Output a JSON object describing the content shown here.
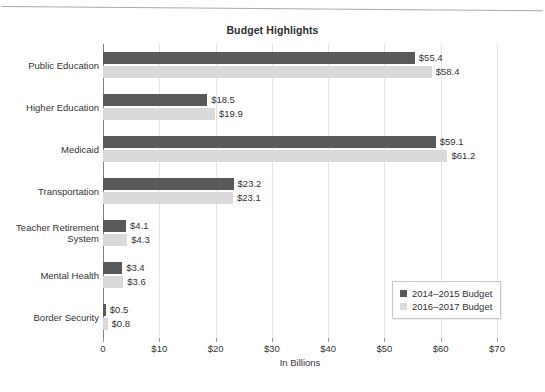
{
  "chart_data": {
    "type": "bar",
    "orientation": "horizontal",
    "title": "Budget Highlights",
    "xlabel": "In Billions",
    "ylabel": "",
    "xlim": [
      0,
      70
    ],
    "xticks": [
      0,
      10,
      20,
      30,
      40,
      50,
      60,
      70
    ],
    "xtick_labels": [
      "0",
      "$10",
      "$20",
      "$30",
      "$40",
      "$50",
      "$60",
      "$70"
    ],
    "grid": true,
    "grid_axis": "x",
    "legend_position": "lower right",
    "categories": [
      "Public Education",
      "Higher Education",
      "Medicaid",
      "Transportation",
      "Teacher Retirement System",
      "Mental Health",
      "Border Security"
    ],
    "series": [
      {
        "name": "2014–2015 Budget",
        "color": "#595959",
        "values": [
          55.4,
          18.5,
          59.1,
          23.2,
          4.1,
          3.4,
          0.5
        ],
        "labels": [
          "$55.4",
          "$18.5",
          "$59.1",
          "$23.2",
          "$4.1",
          "$3.4",
          "$0.5"
        ]
      },
      {
        "name": "2016–2017 Budget",
        "color": "#d9d9d9",
        "values": [
          58.4,
          19.9,
          61.2,
          23.1,
          4.3,
          3.6,
          0.8
        ],
        "labels": [
          "$58.4",
          "$19.9",
          "$61.2",
          "$23.1",
          "$4.3",
          "$3.6",
          "$0.8"
        ]
      }
    ]
  },
  "category_label_lines": [
    [
      "Public Education"
    ],
    [
      "Higher Education"
    ],
    [
      "Medicaid"
    ],
    [
      "Transportation"
    ],
    [
      "Teacher Retirement",
      "System"
    ],
    [
      "Mental Health"
    ],
    [
      "Border Security"
    ]
  ]
}
